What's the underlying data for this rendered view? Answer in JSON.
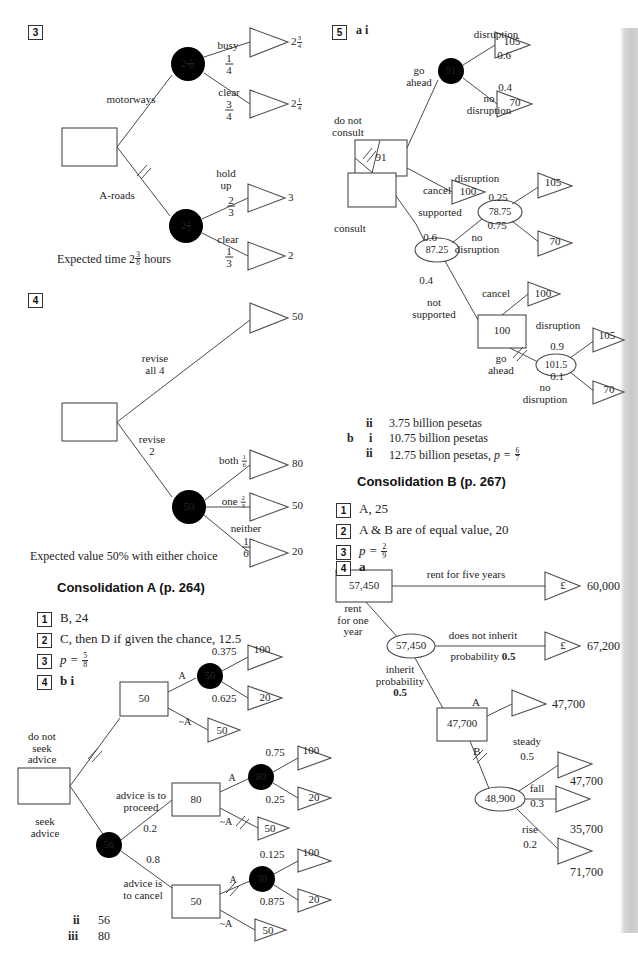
{
  "page": {
    "width": 638,
    "height": 963,
    "background": "#ffffff",
    "edge_strip_color": "#cfcfcf"
  },
  "left_column": {
    "q3": {
      "number": "3",
      "root_label": "",
      "branches": {
        "motorways": "motorways",
        "a_roads": "A-roads"
      },
      "nodes": {
        "motorway_circle_whole": "2",
        "motorway_circle_num": "3",
        "motorway_circle_den": "16",
        "aroad_circle_whole": "2",
        "aroad_circle_num": "2",
        "aroad_circle_den": "3"
      },
      "outcomes": [
        {
          "label": "busy",
          "prob_num": "1",
          "prob_den": "4",
          "value_whole": "2",
          "value_num": "3",
          "value_den": "4"
        },
        {
          "label": "clear",
          "prob_num": "3",
          "prob_den": "4",
          "value_whole": "2",
          "value_num": "1",
          "value_den": "4"
        },
        {
          "label": "hold up",
          "prob_num": "2",
          "prob_den": "3",
          "value": "3"
        },
        {
          "label": "clear",
          "prob_num": "1",
          "prob_den": "3",
          "value": "2"
        }
      ],
      "conclusion_pre": "Expected time 2",
      "conclusion_num": "3",
      "conclusion_den": "8",
      "conclusion_post": " hours"
    },
    "q4": {
      "number": "4",
      "branches": {
        "top": "revise all 4",
        "bottom_line1": "revise",
        "bottom_line2": "2"
      },
      "node_circle": "50",
      "outcomes": [
        {
          "label": "",
          "value": "50"
        },
        {
          "label": "both",
          "prob_num": "1",
          "prob_den": "6",
          "value": "80"
        },
        {
          "label": "one",
          "prob_num": "2",
          "prob_den": "3",
          "value": "50"
        },
        {
          "label": "neither",
          "prob_num": "1",
          "prob_den": "6",
          "value": "20"
        }
      ],
      "conclusion": "Expected value 50% with either choice"
    },
    "consolidation_a": {
      "heading": "Consolidation A (p. 264)",
      "answers": [
        {
          "number": "1",
          "text": "B, 24"
        },
        {
          "number": "2",
          "text": "C, then D if given the chance, 12.5"
        },
        {
          "number": "3",
          "text_pre": "p = ",
          "frac_num": "5",
          "frac_den": "8"
        },
        {
          "number": "4",
          "text": "b  i"
        }
      ],
      "tree": {
        "root_label": "",
        "branch_do_not_seek": "do not seek advice",
        "branch_seek": "seek advice",
        "node_decision_top": "50",
        "node_circle_top": "50",
        "node_chance_seek": "56",
        "branch_proceed_l1": "advice is to",
        "branch_proceed_l2": "proceed",
        "prob_proceed": "0.2",
        "branch_cancel_l1": "advice is",
        "branch_cancel_l2": "to cancel",
        "prob_cancel": "0.8",
        "node_decision_proceed": "80",
        "node_circle_proceed": "80",
        "node_decision_cancel": "50",
        "node_circle_cancel": "30",
        "label_A": "A",
        "label_notA": "~A",
        "outcomes_top": [
          {
            "prob": "0.375",
            "value": "100"
          },
          {
            "prob": "0.625",
            "value": "20"
          },
          {
            "prob": "",
            "value": "50"
          }
        ],
        "outcomes_proceed": [
          {
            "prob": "0.75",
            "value": "100"
          },
          {
            "prob": "0.25",
            "value": "20"
          },
          {
            "prob": "",
            "value": "50"
          }
        ],
        "outcomes_cancel": [
          {
            "prob": "0.125",
            "value": "100"
          },
          {
            "prob": "0.875",
            "value": "20"
          },
          {
            "prob": "",
            "value": "50"
          }
        ]
      },
      "sub_answers": [
        {
          "label": "ii",
          "text": "56"
        },
        {
          "label": "iii",
          "text": "80"
        }
      ]
    }
  },
  "right_column": {
    "q5": {
      "number": "5",
      "parts": "a  i",
      "tree": {
        "branch_do_not_consult_l1": "do not",
        "branch_do_not_consult_l2": "consult",
        "branch_consult": "consult",
        "node_decision_top": "91",
        "node_circle_top": "91",
        "branch_go_ahead_l1": "go",
        "branch_go_ahead_l2": "ahead",
        "branch_cancel": "cancel",
        "cancel_value_top": "100",
        "outcomes_top": [
          {
            "label": "disruption",
            "prob": "0.6",
            "value": "105"
          },
          {
            "label": "no disruption",
            "prob": "0.4",
            "value": "70"
          }
        ],
        "node_chance_consult": "87.25",
        "branch_supported": "supported",
        "prob_supported": "0.6",
        "node_circle_supported": "78.75",
        "outcomes_supported": [
          {
            "label": "disruption",
            "prob": "0.25",
            "value": "105"
          },
          {
            "label": "no disruption",
            "prob": "0.75",
            "value": "70"
          }
        ],
        "branch_not_supported_l1": "not",
        "branch_not_supported_l2": "supported",
        "prob_not_supported": "0.4",
        "node_decision_not_supported": "100",
        "branch_cancel2": "cancel",
        "cancel_value2": "100",
        "branch_go_ahead2_l1": "go",
        "branch_go_ahead2_l2": "ahead",
        "node_circle_not_supported": "101.5",
        "outcomes_not_supported": [
          {
            "label": "disruption",
            "prob": "0.9",
            "value": "105"
          },
          {
            "label": "no disruption",
            "prob": "0.1",
            "value": "70"
          }
        ]
      },
      "answers": [
        {
          "marker_b": "",
          "marker_r": "ii",
          "text": "3.75 billion pesetas"
        },
        {
          "marker_b": "b",
          "marker_r": "i",
          "text": "10.75 billion pesetas"
        },
        {
          "marker_b": "",
          "marker_r": "ii",
          "text": "12.75 billion pesetas, ",
          "has_frac": true,
          "frac_pre": "p = ",
          "frac_num": "6",
          "frac_den": "7"
        }
      ]
    },
    "consolidation_b": {
      "heading": "Consolidation B (p. 267)",
      "answers": [
        {
          "number": "1",
          "text": "A, 25"
        },
        {
          "number": "2",
          "text": "A & B are of equal value, 20"
        },
        {
          "number": "3",
          "text_pre": "p = ",
          "frac_num": "2",
          "frac_den": "9"
        },
        {
          "number": "4",
          "text": "a"
        }
      ],
      "tree": {
        "node_decision_root": "57,450",
        "branch_rent_five": "rent for five years",
        "outcome_five_currency": "£",
        "outcome_five_value": "60,000",
        "branch_rent_one_l1": "rent",
        "branch_rent_one_l2": "for one",
        "branch_rent_one_l3": "year",
        "node_circle_one": "57,450",
        "branch_not_inherit_l1": "does not inherit",
        "branch_not_inherit_l2_pre": "probability ",
        "branch_not_inherit_l2_val": "0.5",
        "outcome_not_inherit_currency": "£",
        "outcome_not_inherit_value": "67,200",
        "branch_inherit_l1": "inherit",
        "branch_inherit_l2": "probability",
        "branch_inherit_l3": "0.5",
        "node_decision_inherit": "47,700",
        "label_A": "A",
        "outcome_A_value": "47,700",
        "label_B": "B",
        "node_circle_B": "48,900",
        "outcomes_B": [
          {
            "label": "steady",
            "prob": "0.5",
            "value": "47,700"
          },
          {
            "label": "fall",
            "prob": "0.3",
            "value": "35,700"
          },
          {
            "label": "rise",
            "prob": "0.2",
            "value": "71,700"
          }
        ]
      }
    }
  }
}
